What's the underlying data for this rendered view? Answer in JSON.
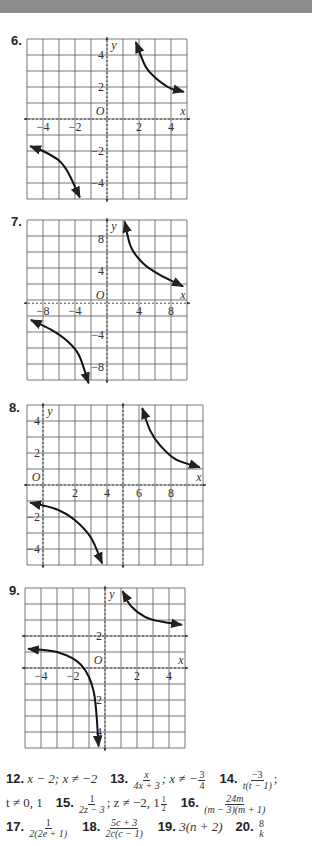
{
  "header_bar_color": "#8c8c8c",
  "chart_data": [
    {
      "type": "line",
      "problem": "6.",
      "xlabel": "x",
      "ylabel": "y",
      "origin_label": "O",
      "xlim": [
        -5,
        5
      ],
      "ylim": [
        -5,
        5
      ],
      "grid": true,
      "cell_units": 1,
      "x_ticks": [
        "-4",
        "-2",
        "2",
        "4"
      ],
      "x_tick_values": [
        -4,
        -2,
        2,
        4
      ],
      "y_ticks": [
        "4",
        "2",
        "-2",
        "-4"
      ],
      "y_tick_values": [
        4,
        2,
        -2,
        -4
      ],
      "asymptotes": {
        "vertical": [
          0
        ],
        "horizontal": [
          0
        ]
      },
      "curves": [
        {
          "branch": "upper-right",
          "points": [
            [
              1.8,
              4.8
            ],
            [
              2.4,
              3.3
            ],
            [
              3.0,
              2.6
            ],
            [
              4.0,
              1.9
            ],
            [
              4.8,
              1.7
            ]
          ]
        },
        {
          "branch": "lower-left",
          "points": [
            [
              -4.8,
              -1.7
            ],
            [
              -4.0,
              -2.0
            ],
            [
              -3.0,
              -2.6
            ],
            [
              -2.4,
              -3.4
            ],
            [
              -1.7,
              -4.9
            ]
          ]
        }
      ]
    },
    {
      "type": "line",
      "problem": "7.",
      "xlabel": "x",
      "ylabel": "y",
      "origin_label": "O",
      "xlim": [
        -10,
        10
      ],
      "ylim": [
        -10,
        10
      ],
      "grid": true,
      "cell_units": 2,
      "x_ticks": [
        "-8",
        "-4",
        "4",
        "8"
      ],
      "x_tick_values": [
        -8,
        -4,
        4,
        8
      ],
      "y_ticks": [
        "8",
        "4",
        "-4",
        "-8"
      ],
      "y_tick_values": [
        8,
        4,
        -4,
        -8
      ],
      "asymptotes": {
        "vertical": [
          0
        ],
        "horizontal": [
          0
        ]
      },
      "curves": [
        {
          "branch": "upper-right",
          "points": [
            [
              2.2,
              10.2
            ],
            [
              3.0,
              7.0
            ],
            [
              4.5,
              5.0
            ],
            [
              6.5,
              3.6
            ],
            [
              9.5,
              2.1
            ]
          ]
        },
        {
          "branch": "lower-left",
          "points": [
            [
              -9.5,
              -2.1
            ],
            [
              -7.0,
              -3.3
            ],
            [
              -5.0,
              -4.7
            ],
            [
              -3.5,
              -6.5
            ],
            [
              -2.3,
              -10.0
            ]
          ]
        }
      ]
    },
    {
      "type": "line",
      "problem": "8.",
      "xlabel": "x",
      "ylabel": "y",
      "origin_label": "O",
      "xlim": [
        -1,
        10
      ],
      "ylim": [
        -5,
        5
      ],
      "grid": true,
      "cell_units": 1,
      "x_ticks": [
        "2",
        "4",
        "6",
        "8"
      ],
      "x_tick_values": [
        2,
        4,
        6,
        8
      ],
      "y_ticks": [
        "4",
        "2",
        "-2",
        "-4"
      ],
      "y_tick_values": [
        4,
        2,
        -2,
        -4
      ],
      "asymptotes": {
        "vertical": [
          5
        ],
        "horizontal": [
          0
        ]
      },
      "curves": [
        {
          "branch": "upper-right",
          "points": [
            [
              6.2,
              4.8
            ],
            [
              6.7,
              3.4
            ],
            [
              7.3,
              2.5
            ],
            [
              8.3,
              1.6
            ],
            [
              9.8,
              1.1
            ]
          ]
        },
        {
          "branch": "lower-left",
          "points": [
            [
              -0.8,
              -1.1
            ],
            [
              0.8,
              -1.5
            ],
            [
              2.0,
              -2.2
            ],
            [
              3.0,
              -3.3
            ],
            [
              3.7,
              -4.9
            ]
          ]
        }
      ]
    },
    {
      "type": "line",
      "problem": "9.",
      "xlabel": "x",
      "ylabel": "y",
      "origin_label": "O",
      "xlim": [
        -5,
        5
      ],
      "ylim": [
        -5,
        5
      ],
      "grid": true,
      "cell_units": 1,
      "x_ticks": [
        "-4",
        "-2",
        "2",
        "4"
      ],
      "x_tick_values": [
        -4,
        -2,
        2,
        4
      ],
      "y_ticks": [
        "2",
        "-2",
        "-4"
      ],
      "y_tick_values": [
        2,
        -2,
        -4
      ],
      "asymptotes": {
        "vertical": [
          0
        ],
        "horizontal": [
          2
        ]
      },
      "curves": [
        {
          "branch": "upper-right",
          "points": [
            [
              1.1,
              4.8
            ],
            [
              1.6,
              3.9
            ],
            [
              2.5,
              3.2
            ],
            [
              3.5,
              2.9
            ],
            [
              4.8,
              2.7
            ]
          ]
        },
        {
          "branch": "lower-left",
          "points": [
            [
              -4.8,
              1.2
            ],
            [
              -3.0,
              1.0
            ],
            [
              -1.5,
              0.2
            ],
            [
              -0.7,
              -1.5
            ],
            [
              -0.4,
              -4.9
            ]
          ]
        }
      ]
    }
  ],
  "answers": {
    "line1": {
      "q12": {
        "num": "12.",
        "text": "x − 2; x ≠ −2"
      },
      "q13": {
        "num": "13.",
        "frac_num": "x",
        "frac_den": "4x + 3",
        "rest": "; x ≠ −",
        "r_num": "3",
        "r_den": "4"
      },
      "q14": {
        "num": "14.",
        "frac_num": "−3",
        "frac_den": "t(t − 1)",
        "rest": ";"
      }
    },
    "line2": {
      "q14_cont": "t ≠ 0, 1",
      "q15": {
        "num": "15.",
        "frac_num": "1",
        "frac_den": "2z − 3",
        "rest": "; z ≠ −2, 1",
        "mix_num": "1",
        "mix_den": "2"
      },
      "q16": {
        "num": "16.",
        "frac_num": "24m",
        "frac_den": "(m − 3)(m + 1)"
      }
    },
    "line3": {
      "q17": {
        "num": "17.",
        "frac_num": "1",
        "frac_den": "2(2e + 1)"
      },
      "q18": {
        "num": "18.",
        "frac_num": "5c + 3",
        "frac_den": "2c(c − 1)"
      },
      "q19": {
        "num": "19.",
        "text": "3(n + 2)"
      },
      "q20": {
        "num": "20.",
        "frac_num": "8",
        "frac_den": "k"
      }
    }
  }
}
